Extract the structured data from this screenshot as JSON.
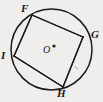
{
  "figure": {
    "background_color": "#f0eeec",
    "stroke_color": "#1a1a1a",
    "circle": {
      "label": "O",
      "center_x": 51.5,
      "center_y": 49.5,
      "radius": 40.5,
      "center_dot_x": 54.0,
      "center_dot_y": 46.0,
      "center_dot_radius": 1.6,
      "stroke_width": 1.5
    },
    "quadrilateral": {
      "name": "FGHI",
      "stroke_width": 1.3,
      "fill": "none",
      "vertices": [
        {
          "label": "F",
          "x": 32,
          "y": 15,
          "label_x": 21,
          "label_y": 3
        },
        {
          "label": "G",
          "x": 83,
          "y": 37,
          "label_x": 91,
          "label_y": 29
        },
        {
          "label": "H",
          "x": 63,
          "y": 87,
          "label_x": 57,
          "label_y": 88
        },
        {
          "label": "I",
          "x": 14,
          "y": 56,
          "label_x": 1,
          "label_y": 50
        }
      ],
      "sides": [
        {
          "name": "FG",
          "from": "F",
          "to": "G"
        },
        {
          "name": "GH",
          "from": "G",
          "to": "H"
        },
        {
          "name": "HI",
          "from": "H",
          "to": "I"
        },
        {
          "name": "IF",
          "from": "I",
          "to": "F"
        }
      ]
    },
    "tick_mark": {
      "name": "side-GH-tick",
      "x1": 74.5,
      "y1": 66.0,
      "x2": 78.0,
      "y2": 69.5,
      "stroke_width": 0.8,
      "opacity": 0.45
    },
    "center_label_text": "O"
  }
}
